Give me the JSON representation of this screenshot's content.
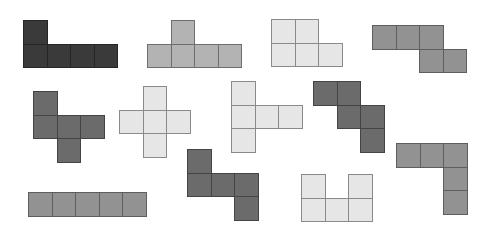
{
  "cell_size": 23.5,
  "palette": {
    "dark": {
      "fill": "#3a3a3a",
      "border": "#262626"
    },
    "darkgray": {
      "fill": "#6b6b6b",
      "border": "#444444"
    },
    "gray": {
      "fill": "#929292",
      "border": "#5e5e5e"
    },
    "midgray": {
      "fill": "#b3b3b3",
      "border": "#6e6e6e"
    },
    "light": {
      "fill": "#e6e6e6",
      "border": "#8a8a8a"
    }
  },
  "shapes": [
    {
      "name": "pentomino-L-dark",
      "color": "dark",
      "origin": [
        23,
        20
      ],
      "cells": [
        [
          0,
          0
        ],
        [
          0,
          1
        ],
        [
          1,
          1
        ],
        [
          2,
          1
        ],
        [
          3,
          1
        ]
      ]
    },
    {
      "name": "pentomino-Y-midgray",
      "color": "midgray",
      "origin": [
        147,
        20
      ],
      "cells": [
        [
          1,
          0
        ],
        [
          0,
          1
        ],
        [
          1,
          1
        ],
        [
          2,
          1
        ],
        [
          3,
          1
        ]
      ]
    },
    {
      "name": "pentomino-P-light",
      "color": "light",
      "origin": [
        271,
        19
      ],
      "cells": [
        [
          0,
          0
        ],
        [
          1,
          0
        ],
        [
          0,
          1
        ],
        [
          1,
          1
        ],
        [
          2,
          1
        ]
      ]
    },
    {
      "name": "pentomino-N-gray",
      "color": "gray",
      "origin": [
        372,
        25
      ],
      "cells": [
        [
          0,
          0
        ],
        [
          1,
          0
        ],
        [
          2,
          0
        ],
        [
          2,
          1
        ],
        [
          3,
          1
        ]
      ]
    },
    {
      "name": "pentomino-F-darkgray",
      "color": "darkgray",
      "origin": [
        33,
        91
      ],
      "cells": [
        [
          0,
          0
        ],
        [
          0,
          1
        ],
        [
          1,
          1
        ],
        [
          2,
          1
        ],
        [
          1,
          2
        ]
      ]
    },
    {
      "name": "pentomino-X-light",
      "color": "light",
      "origin": [
        119,
        86
      ],
      "cells": [
        [
          1,
          0
        ],
        [
          0,
          1
        ],
        [
          1,
          1
        ],
        [
          2,
          1
        ],
        [
          1,
          2
        ]
      ]
    },
    {
      "name": "pentomino-T-light",
      "color": "light",
      "origin": [
        231,
        81
      ],
      "cells": [
        [
          0,
          0
        ],
        [
          0,
          1
        ],
        [
          1,
          1
        ],
        [
          2,
          1
        ],
        [
          0,
          2
        ]
      ]
    },
    {
      "name": "pentomino-W-darkgray",
      "color": "darkgray",
      "origin": [
        313,
        81
      ],
      "cells": [
        [
          0,
          0
        ],
        [
          1,
          0
        ],
        [
          1,
          1
        ],
        [
          2,
          1
        ],
        [
          2,
          2
        ]
      ]
    },
    {
      "name": "pentomino-V-gray",
      "color": "gray",
      "origin": [
        396,
        143
      ],
      "cells": [
        [
          0,
          0
        ],
        [
          1,
          0
        ],
        [
          2,
          0
        ],
        [
          2,
          1
        ],
        [
          2,
          2
        ]
      ]
    },
    {
      "name": "pentomino-Z-darkgray",
      "color": "darkgray",
      "origin": [
        187,
        149
      ],
      "cells": [
        [
          0,
          0
        ],
        [
          0,
          1
        ],
        [
          1,
          1
        ],
        [
          2,
          1
        ],
        [
          2,
          2
        ]
      ]
    },
    {
      "name": "pentomino-U-light",
      "color": "light",
      "origin": [
        301,
        174
      ],
      "cells": [
        [
          0,
          0
        ],
        [
          2,
          0
        ],
        [
          0,
          1
        ],
        [
          1,
          1
        ],
        [
          2,
          1
        ]
      ]
    },
    {
      "name": "pentomino-I-gray",
      "color": "gray",
      "origin": [
        28,
        192
      ],
      "cells": [
        [
          0,
          0
        ],
        [
          1,
          0
        ],
        [
          2,
          0
        ],
        [
          3,
          0
        ],
        [
          4,
          0
        ]
      ]
    }
  ]
}
